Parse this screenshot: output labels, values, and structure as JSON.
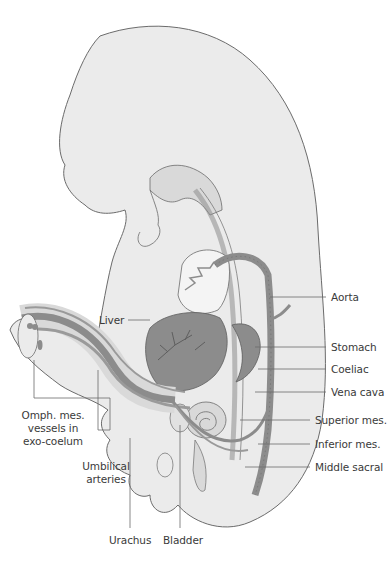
{
  "diagram": {
    "colors": {
      "body_fill": "#ebebeb",
      "outline": "#6b6b6b",
      "organ_fill": "#8c8c8c",
      "vessel_fill": "#9a9a9a",
      "light_fill": "#d9d9d9",
      "leader_line": "#6b6b6b",
      "text": "#3a3a3a"
    },
    "labels": {
      "aorta": "Aorta",
      "liver": "Liver",
      "stomach": "Stomach",
      "coeliac": "Coeliac",
      "vena_cava": "Vena cava",
      "superior_mes": "Superior mes.",
      "inferior_mes": "Inferior mes.",
      "middle_sacral": "Middle sacral",
      "omph_mes_line1": "Omph. mes.",
      "omph_mes_line2": "vessels in",
      "omph_mes_line3": "exo-coelum",
      "umbilical_line1": "Umbilical",
      "umbilical_line2": "arteries",
      "urachus": "Urachus",
      "bladder": "Bladder"
    }
  }
}
